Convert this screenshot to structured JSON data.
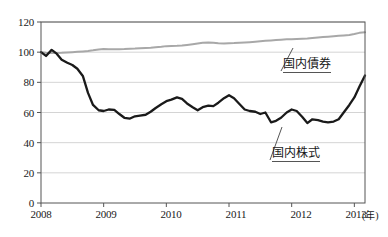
{
  "chart_data": {
    "type": "line",
    "title": "",
    "xlabel": "年",
    "ylabel": "",
    "xlim": [
      2008.0,
      2013.17
    ],
    "ylim": [
      0,
      120
    ],
    "grid": true,
    "grid_axis": "y",
    "legend_position": "inline-annotation",
    "x_tick_labels": [
      "2008",
      "2009",
      "2010",
      "2011",
      "2012",
      "2013"
    ],
    "x_tick_values": [
      2008,
      2009,
      2010,
      2011,
      2012,
      2013
    ],
    "y_tick_labels": [
      "0",
      "20",
      "40",
      "60",
      "80",
      "100",
      "120"
    ],
    "y_tick_values": [
      0,
      20,
      40,
      60,
      80,
      100,
      120
    ],
    "unit_note": "(年)",
    "series": [
      {
        "name": "国内債券",
        "color": "#a8a8a8",
        "width": 2.0,
        "annotation_label": "国内債券",
        "x": [
          2008.0,
          2008.08,
          2008.17,
          2008.25,
          2008.33,
          2008.42,
          2008.5,
          2008.58,
          2008.67,
          2008.75,
          2008.83,
          2008.92,
          2009.0,
          2009.08,
          2009.17,
          2009.25,
          2009.33,
          2009.42,
          2009.5,
          2009.58,
          2009.67,
          2009.75,
          2009.83,
          2009.92,
          2010.0,
          2010.08,
          2010.17,
          2010.25,
          2010.33,
          2010.42,
          2010.5,
          2010.58,
          2010.67,
          2010.75,
          2010.83,
          2010.92,
          2011.0,
          2011.08,
          2011.17,
          2011.25,
          2011.33,
          2011.42,
          2011.5,
          2011.58,
          2011.67,
          2011.75,
          2011.83,
          2011.92,
          2012.0,
          2012.08,
          2012.17,
          2012.25,
          2012.33,
          2012.42,
          2012.5,
          2012.58,
          2012.67,
          2012.75,
          2012.83,
          2012.92,
          2013.0,
          2013.08,
          2013.17
        ],
        "y": [
          100.0,
          99.6,
          99.4,
          99.5,
          99.6,
          99.8,
          100.0,
          100.2,
          100.5,
          100.8,
          101.2,
          101.8,
          102.1,
          102.0,
          101.9,
          102.0,
          102.1,
          102.3,
          102.4,
          102.6,
          102.8,
          103.0,
          103.3,
          103.6,
          104.0,
          104.1,
          104.2,
          104.4,
          104.8,
          105.3,
          105.8,
          106.2,
          106.4,
          106.2,
          105.9,
          105.8,
          105.9,
          106.0,
          106.2,
          106.4,
          106.6,
          106.9,
          107.2,
          107.5,
          107.8,
          108.1,
          108.3,
          108.5,
          108.6,
          108.7,
          108.9,
          109.1,
          109.4,
          109.7,
          110.0,
          110.3,
          110.6,
          110.9,
          111.1,
          111.4,
          112.0,
          112.8,
          113.2
        ]
      },
      {
        "name": "国内株式",
        "color": "#1a1a1a",
        "width": 2.3,
        "annotation_label": "国内株式",
        "x": [
          2008.0,
          2008.08,
          2008.17,
          2008.25,
          2008.33,
          2008.42,
          2008.5,
          2008.58,
          2008.67,
          2008.75,
          2008.83,
          2008.92,
          2009.0,
          2009.08,
          2009.17,
          2009.25,
          2009.33,
          2009.42,
          2009.5,
          2009.58,
          2009.67,
          2009.75,
          2009.83,
          2009.92,
          2010.0,
          2010.08,
          2010.17,
          2010.25,
          2010.33,
          2010.42,
          2010.5,
          2010.58,
          2010.67,
          2010.75,
          2010.83,
          2010.92,
          2011.0,
          2011.08,
          2011.17,
          2011.25,
          2011.33,
          2011.42,
          2011.5,
          2011.58,
          2011.67,
          2011.75,
          2011.83,
          2011.92,
          2012.0,
          2012.08,
          2012.17,
          2012.25,
          2012.33,
          2012.42,
          2012.5,
          2012.58,
          2012.67,
          2012.75,
          2012.83,
          2012.92,
          2013.0,
          2013.08,
          2013.17
        ],
        "y": [
          100.0,
          97.5,
          101.5,
          99.0,
          95.0,
          93.0,
          91.5,
          89.0,
          84.0,
          73.0,
          65.0,
          61.5,
          61.0,
          62.0,
          61.8,
          59.0,
          56.5,
          56.0,
          57.5,
          58.0,
          58.5,
          60.5,
          63.0,
          65.5,
          67.5,
          68.5,
          70.0,
          69.0,
          66.0,
          63.5,
          61.5,
          63.5,
          64.5,
          64.2,
          66.5,
          69.5,
          71.5,
          69.5,
          65.5,
          62.0,
          61.0,
          60.5,
          59.0,
          60.0,
          59.5,
          59.5,
          61.5,
          64.0,
          66.0,
          67.5,
          68.5,
          67.0,
          65.0,
          64.0,
          63.0,
          62.0,
          59.5,
          57.0,
          56.0,
          55.5,
          54.0,
          53.5,
          53.0
        ]
      }
    ],
    "series_extra_note": "stock series continues through 2013 with late recovery",
    "stock_tail": {
      "x": [
        2011.58,
        2011.67,
        2011.75,
        2011.83,
        2011.92,
        2012.0,
        2012.08,
        2012.17,
        2012.25,
        2012.33,
        2012.42,
        2012.5,
        2012.58,
        2012.67,
        2012.75,
        2012.83,
        2012.92,
        2013.0,
        2013.08,
        2013.17
      ],
      "y": [
        53.0,
        53.5,
        54.5,
        56.5,
        60.0,
        62.0,
        61.0,
        57.0,
        53.0,
        55.5,
        55.0,
        54.0,
        53.5,
        54.0,
        55.5,
        60.0,
        65.0,
        70.0,
        77.0,
        84.5
      ]
    }
  },
  "axis": {
    "unit_suffix": "(年)"
  }
}
